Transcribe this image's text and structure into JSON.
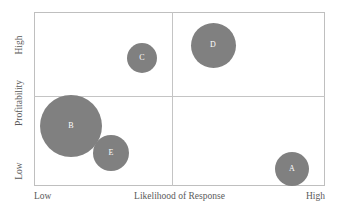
{
  "chart_data": {
    "type": "scatter",
    "title": "",
    "xlabel": "Likelihood of Response",
    "ylabel": "Profitability",
    "x_tick_labels": [
      "Low",
      "High"
    ],
    "y_tick_labels": [
      "Low",
      "High"
    ],
    "xlim": [
      0,
      100
    ],
    "ylim": [
      0,
      100
    ],
    "grid": false,
    "legend": "none",
    "quadrant_divider_x": 47,
    "quadrant_divider_y": 52,
    "bubble_color": "#808080",
    "label_color": "#ffffff",
    "frame_color": "#bfbfbf",
    "points": [
      {
        "label": "A",
        "x": 88,
        "y": 10,
        "size": 34,
        "cx_px": 292,
        "cy_px": 169,
        "r_px": 17,
        "color": "#808080"
      },
      {
        "label": "B",
        "x": 13,
        "y": 35,
        "size": 62,
        "cx_px": 71,
        "cy_px": 126,
        "r_px": 31,
        "color": "#808080"
      },
      {
        "label": "C",
        "x": 37,
        "y": 74,
        "size": 30,
        "cx_px": 142,
        "cy_px": 58,
        "r_px": 15,
        "color": "#808080"
      },
      {
        "label": "D",
        "x": 62,
        "y": 81,
        "size": 45,
        "cx_px": 213,
        "cy_px": 45,
        "r_px": 22.5,
        "color": "#808080"
      },
      {
        "label": "E",
        "x": 26,
        "y": 19,
        "size": 36,
        "cx_px": 111,
        "cy_px": 153,
        "r_px": 18,
        "color": "#808080"
      }
    ]
  },
  "axes": {
    "x": {
      "low_label": "Low",
      "title": "Likelihood of Response",
      "high_label": "High"
    },
    "y": {
      "low_label": "Low",
      "title": "Profitability",
      "high_label": "High"
    }
  }
}
